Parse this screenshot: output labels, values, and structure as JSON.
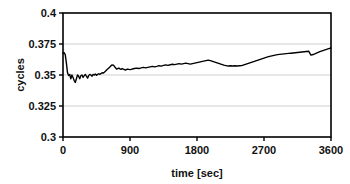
{
  "chart_data": {
    "type": "line",
    "title": "",
    "xlabel": "time [sec]",
    "ylabel": "cycles",
    "xlim": [
      0,
      3600
    ],
    "ylim": [
      0.3,
      0.4
    ],
    "xticks": [
      0,
      900,
      1800,
      2700,
      3600
    ],
    "xtick_labels": [
      "0",
      "900",
      "1800",
      "2700",
      "3600"
    ],
    "yticks": [
      0.3,
      0.325,
      0.35,
      0.375,
      0.4
    ],
    "ytick_labels": [
      "0.3",
      "0.325",
      "0.35",
      "0.375",
      "0.4"
    ],
    "grid": "horizontal",
    "gridlines_at": [
      0.325,
      0.35,
      0.375
    ],
    "legend": "none",
    "line_color": "#000000",
    "line_width": 1.4,
    "frame_color": "#000000",
    "grid_color": "#cfcfcf",
    "series": [
      {
        "name": "cycles",
        "x": [
          0,
          15,
          30,
          45,
          60,
          75,
          90,
          105,
          120,
          135,
          150,
          165,
          180,
          195,
          210,
          225,
          240,
          255,
          270,
          285,
          300,
          315,
          330,
          345,
          360,
          375,
          390,
          405,
          420,
          435,
          450,
          465,
          480,
          495,
          510,
          525,
          540,
          555,
          570,
          585,
          600,
          615,
          630,
          645,
          660,
          675,
          690,
          705,
          720,
          735,
          750,
          765,
          780,
          795,
          810,
          825,
          840,
          855,
          870,
          885,
          900,
          930,
          960,
          990,
          1020,
          1050,
          1080,
          1110,
          1140,
          1170,
          1200,
          1230,
          1260,
          1290,
          1320,
          1350,
          1380,
          1410,
          1440,
          1470,
          1500,
          1530,
          1560,
          1590,
          1620,
          1650,
          1680,
          1710,
          1740,
          1770,
          1800,
          1830,
          1860,
          1890,
          1920,
          1950,
          1980,
          2010,
          2040,
          2070,
          2100,
          2130,
          2160,
          2190,
          2220,
          2250,
          2280,
          2310,
          2340,
          2370,
          2400,
          2430,
          2460,
          2490,
          2520,
          2550,
          2580,
          2610,
          2640,
          2670,
          2700,
          2730,
          2760,
          2790,
          2820,
          2850,
          2880,
          2910,
          2940,
          2970,
          3000,
          3030,
          3060,
          3090,
          3120,
          3150,
          3180,
          3210,
          3240,
          3270,
          3300,
          3330,
          3360,
          3390,
          3420,
          3450,
          3480,
          3510,
          3540,
          3570,
          3600
        ],
        "y": [
          0.3675,
          0.368,
          0.3665,
          0.36,
          0.352,
          0.3495,
          0.3505,
          0.347,
          0.35,
          0.348,
          0.3455,
          0.344,
          0.347,
          0.35,
          0.349,
          0.347,
          0.3495,
          0.35,
          0.348,
          0.3495,
          0.3505,
          0.349,
          0.3475,
          0.3495,
          0.3505,
          0.35,
          0.349,
          0.3505,
          0.35,
          0.3508,
          0.3498,
          0.3505,
          0.351,
          0.3505,
          0.3512,
          0.3518,
          0.3515,
          0.3522,
          0.353,
          0.354,
          0.3548,
          0.3556,
          0.3565,
          0.3575,
          0.3582,
          0.358,
          0.357,
          0.3558,
          0.3548,
          0.3552,
          0.3556,
          0.355,
          0.3546,
          0.3552,
          0.3548,
          0.3544,
          0.354,
          0.3545,
          0.3548,
          0.3545,
          0.3543,
          0.3548,
          0.3552,
          0.3556,
          0.3552,
          0.3558,
          0.3562,
          0.3558,
          0.3562,
          0.3566,
          0.357,
          0.3566,
          0.357,
          0.3575,
          0.3572,
          0.3578,
          0.3582,
          0.3578,
          0.3583,
          0.3587,
          0.3584,
          0.3588,
          0.3592,
          0.3588,
          0.3592,
          0.3596,
          0.3592,
          0.3588,
          0.3592,
          0.3596,
          0.36,
          0.3604,
          0.3608,
          0.3612,
          0.3616,
          0.362,
          0.3616,
          0.361,
          0.3604,
          0.3598,
          0.3592,
          0.3586,
          0.358,
          0.3576,
          0.3572,
          0.3574,
          0.3572,
          0.3574,
          0.3572,
          0.3574,
          0.3576,
          0.3582,
          0.3588,
          0.3594,
          0.36,
          0.3606,
          0.3612,
          0.3618,
          0.3624,
          0.363,
          0.3636,
          0.3642,
          0.3648,
          0.3652,
          0.3656,
          0.366,
          0.3664,
          0.3666,
          0.3668,
          0.367,
          0.3672,
          0.3674,
          0.3676,
          0.3678,
          0.368,
          0.3682,
          0.3684,
          0.3686,
          0.3688,
          0.369,
          0.3692,
          0.366,
          0.3665,
          0.3672,
          0.368,
          0.3688,
          0.3694,
          0.37,
          0.3706,
          0.3712,
          0.3718
        ]
      }
    ]
  },
  "axes": {
    "plot_left": 63,
    "plot_right": 331,
    "plot_top": 13,
    "plot_bottom": 137
  }
}
